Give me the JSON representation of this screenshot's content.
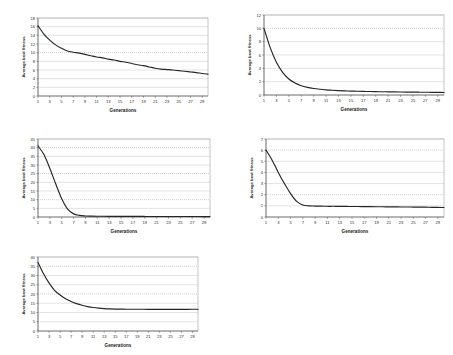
{
  "figure": {
    "background": "#ffffff",
    "series_color": "#262626",
    "grid_color": "#b9b9b9",
    "panel_count": 5
  },
  "common": {
    "xlabel": "Generations",
    "ylabel": "Average best fitness",
    "xticks": [
      "1",
      "3",
      "5",
      "7",
      "9",
      "11",
      "13",
      "15",
      "17",
      "19",
      "21",
      "23",
      "25",
      "27",
      "29"
    ]
  },
  "chart_data": [
    {
      "type": "line",
      "id": "panel-1",
      "title": "",
      "xlabel": "Generations",
      "ylabel": "Average best fitness",
      "xlim": [
        1,
        30
      ],
      "ylim": [
        0,
        18
      ],
      "yticks": [
        0,
        2,
        4,
        6,
        8,
        10,
        12,
        14,
        16,
        18
      ],
      "xticks": [
        1,
        3,
        5,
        7,
        9,
        11,
        13,
        15,
        17,
        19,
        21,
        23,
        25,
        27,
        29
      ],
      "grid": true,
      "legend": "none",
      "x": [
        1,
        2,
        3,
        4,
        5,
        6,
        7,
        8,
        9,
        10,
        11,
        12,
        13,
        14,
        15,
        16,
        17,
        18,
        19,
        20,
        21,
        22,
        23,
        24,
        25,
        26,
        27,
        28,
        29,
        30
      ],
      "values": [
        16.2,
        14.3,
        12.9,
        11.8,
        11.0,
        10.4,
        10.1,
        9.9,
        9.6,
        9.3,
        9.0,
        8.8,
        8.5,
        8.3,
        8.0,
        7.8,
        7.5,
        7.2,
        7.0,
        6.7,
        6.4,
        6.2,
        6.1,
        6.0,
        5.85,
        5.7,
        5.55,
        5.4,
        5.2,
        5.05
      ]
    },
    {
      "type": "line",
      "id": "panel-2",
      "title": "",
      "xlabel": "Generations",
      "ylabel": "Average best fitness",
      "xlim": [
        1,
        30
      ],
      "ylim": [
        0,
        12
      ],
      "yticks": [
        0,
        2,
        4,
        6,
        8,
        10,
        12
      ],
      "xticks": [
        1,
        3,
        5,
        7,
        9,
        11,
        13,
        15,
        17,
        19,
        21,
        23,
        25,
        27,
        29
      ],
      "grid": true,
      "legend": "none",
      "x": [
        1,
        2,
        3,
        4,
        5,
        6,
        7,
        8,
        9,
        10,
        11,
        12,
        13,
        14,
        15,
        16,
        17,
        18,
        19,
        20,
        21,
        22,
        23,
        24,
        25,
        26,
        27,
        28,
        29,
        30
      ],
      "values": [
        10.0,
        7.1,
        4.9,
        3.4,
        2.4,
        1.8,
        1.4,
        1.15,
        0.98,
        0.86,
        0.77,
        0.71,
        0.66,
        0.62,
        0.59,
        0.56,
        0.54,
        0.52,
        0.5,
        0.49,
        0.47,
        0.46,
        0.45,
        0.44,
        0.43,
        0.42,
        0.41,
        0.4,
        0.39,
        0.38
      ]
    },
    {
      "type": "line",
      "id": "panel-3",
      "title": "",
      "xlabel": "Generations",
      "ylabel": "Average best fitness",
      "xlim": [
        1,
        30
      ],
      "ylim": [
        0,
        45
      ],
      "yticks": [
        0,
        5,
        10,
        15,
        20,
        25,
        30,
        35,
        40,
        45
      ],
      "xticks": [
        1,
        3,
        5,
        7,
        9,
        11,
        13,
        15,
        17,
        19,
        21,
        23,
        25,
        27,
        29
      ],
      "grid": true,
      "legend": "none",
      "x": [
        1,
        2,
        3,
        4,
        5,
        6,
        7,
        8,
        9,
        10,
        11,
        12,
        13,
        14,
        15,
        16,
        17,
        18,
        19,
        20,
        21,
        22,
        23,
        24,
        25,
        26,
        27,
        28,
        29,
        30
      ],
      "values": [
        41.0,
        36.0,
        28.0,
        19.0,
        10.5,
        4.5,
        1.8,
        0.9,
        0.6,
        0.5,
        0.45,
        0.42,
        0.4,
        0.38,
        0.36,
        0.35,
        0.34,
        0.33,
        0.32,
        0.31,
        0.3,
        0.3,
        0.29,
        0.29,
        0.28,
        0.28,
        0.27,
        0.27,
        0.26,
        0.26
      ]
    },
    {
      "type": "line",
      "id": "panel-4",
      "title": "",
      "xlabel": "Generations",
      "ylabel": "Average best fitness",
      "xlim": [
        1,
        30
      ],
      "ylim": [
        0,
        7
      ],
      "yticks": [
        0,
        1,
        2,
        3,
        4,
        5,
        6,
        7
      ],
      "xticks": [
        1,
        3,
        5,
        7,
        9,
        11,
        13,
        15,
        17,
        19,
        21,
        23,
        25,
        27,
        29
      ],
      "grid": true,
      "legend": "none",
      "x": [
        1,
        2,
        3,
        4,
        5,
        6,
        7,
        8,
        9,
        10,
        11,
        12,
        13,
        14,
        15,
        16,
        17,
        18,
        19,
        20,
        21,
        22,
        23,
        24,
        25,
        26,
        27,
        28,
        29,
        30
      ],
      "values": [
        6.0,
        5.1,
        4.0,
        3.0,
        2.1,
        1.4,
        1.08,
        1.0,
        0.98,
        0.97,
        0.96,
        0.96,
        0.95,
        0.95,
        0.94,
        0.94,
        0.93,
        0.93,
        0.92,
        0.92,
        0.91,
        0.91,
        0.9,
        0.9,
        0.89,
        0.89,
        0.88,
        0.87,
        0.86,
        0.85
      ]
    },
    {
      "type": "line",
      "id": "panel-5",
      "title": "",
      "xlabel": "Generations",
      "ylabel": "Average best fitness",
      "xlim": [
        1,
        30
      ],
      "ylim": [
        0,
        40
      ],
      "yticks": [
        0,
        5,
        10,
        15,
        20,
        25,
        30,
        35,
        40
      ],
      "xticks": [
        1,
        3,
        5,
        7,
        9,
        11,
        13,
        15,
        17,
        19,
        21,
        23,
        25,
        27,
        29
      ],
      "grid": true,
      "legend": "none",
      "x": [
        1,
        2,
        3,
        4,
        5,
        6,
        7,
        8,
        9,
        10,
        11,
        12,
        13,
        14,
        15,
        16,
        17,
        18,
        19,
        20,
        21,
        22,
        23,
        24,
        25,
        26,
        27,
        28,
        29,
        30
      ],
      "values": [
        37.0,
        31.0,
        26.0,
        22.0,
        19.5,
        17.5,
        16.0,
        14.8,
        13.9,
        13.2,
        12.7,
        12.35,
        12.1,
        11.95,
        11.85,
        11.8,
        11.78,
        11.76,
        11.75,
        11.74,
        11.73,
        11.72,
        11.72,
        11.71,
        11.71,
        11.7,
        11.7,
        11.72,
        11.74,
        11.78
      ]
    }
  ]
}
